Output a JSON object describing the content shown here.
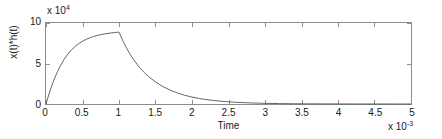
{
  "chart_data": {
    "type": "line",
    "title": "",
    "xlabel": "Time",
    "ylabel": "x(t)*h(t)",
    "x_multiplier_base": "x 10",
    "x_multiplier_exponent": "-3",
    "y_multiplier_base": "x 10",
    "y_multiplier_exponent": "4",
    "xlim": [
      0,
      5
    ],
    "ylim": [
      0,
      10
    ],
    "x_ticks": [
      0,
      0.5,
      1,
      1.5,
      2,
      2.5,
      3,
      3.5,
      4,
      4.5,
      5
    ],
    "x_tick_labels": [
      "0",
      "0.5",
      "1",
      "1.5",
      "2",
      "2.5",
      "3",
      "3.5",
      "4",
      "4.5",
      "5"
    ],
    "y_ticks": [
      0,
      5,
      10
    ],
    "y_tick_labels": [
      "0",
      "5",
      "10"
    ],
    "grid": false,
    "legend": null,
    "line_color": "#555555",
    "axis_color": "#8c8c8c",
    "peak": {
      "x": 1.0,
      "y": 7.9
    },
    "series": [
      {
        "name": "x(t)*h(t)",
        "x": [
          0,
          0.02,
          0.05,
          0.08,
          0.12,
          0.16,
          0.2,
          0.25,
          0.3,
          0.35,
          0.4,
          0.45,
          0.5,
          0.55,
          0.6,
          0.65,
          0.7,
          0.75,
          0.8,
          0.85,
          0.9,
          0.95,
          1.0,
          1.05,
          1.1,
          1.15,
          1.2,
          1.25,
          1.3,
          1.35,
          1.4,
          1.5,
          1.6,
          1.7,
          1.8,
          1.9,
          2.0,
          2.1,
          2.2,
          2.3,
          2.4,
          2.5,
          2.6,
          2.7,
          2.8,
          2.9,
          3.0,
          3.2,
          3.4,
          3.6,
          3.8,
          4.0,
          4.2,
          4.4,
          4.6,
          4.8,
          5.0
        ],
        "y": [
          0,
          0.62,
          1.49,
          2.28,
          3.22,
          4.05,
          4.77,
          5.54,
          6.17,
          6.69,
          7.11,
          7.46,
          7.75,
          7.98,
          8.17,
          8.33,
          8.46,
          8.56,
          8.65,
          8.72,
          8.78,
          8.83,
          8.87,
          7.85,
          6.96,
          6.17,
          5.48,
          4.87,
          4.33,
          3.85,
          3.43,
          2.72,
          2.16,
          1.71,
          1.36,
          1.08,
          0.86,
          0.68,
          0.54,
          0.43,
          0.34,
          0.27,
          0.21,
          0.17,
          0.13,
          0.11,
          0.08,
          0.05,
          0.03,
          0.02,
          0.012,
          0.008,
          0.005,
          0.003,
          0.002,
          0.001,
          0.001
        ]
      }
    ]
  }
}
